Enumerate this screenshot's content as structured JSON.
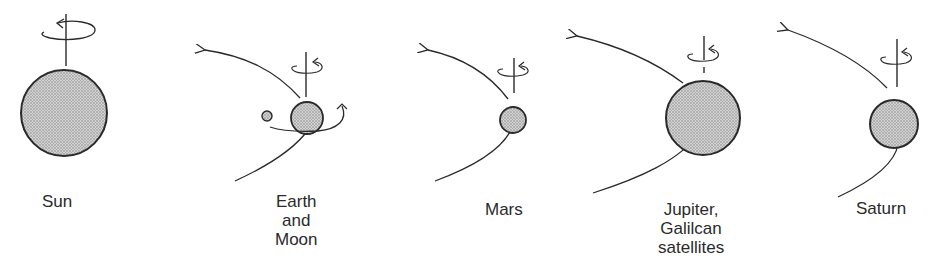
{
  "figure": {
    "colors": {
      "stroke": "#2a2a2a",
      "fill": "#bdbdbd",
      "background": "#ffffff"
    },
    "bodies": [
      {
        "id": "sun",
        "label": "Sun"
      },
      {
        "id": "earth",
        "label_lines": [
          "Earth",
          "and",
          "Moon"
        ]
      },
      {
        "id": "mars",
        "label": "Mars"
      },
      {
        "id": "jupiter",
        "label_lines": [
          "Jupiter,",
          "Galilcan",
          "satellites"
        ]
      },
      {
        "id": "saturn",
        "label": "Saturn"
      }
    ]
  }
}
